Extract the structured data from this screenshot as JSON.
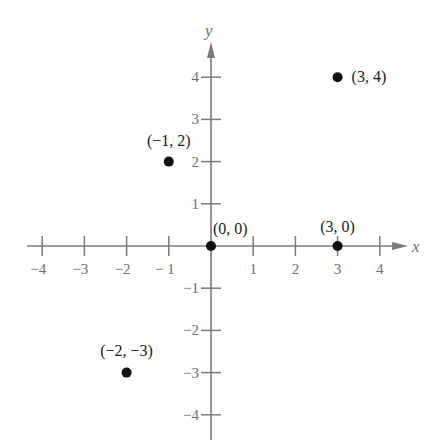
{
  "chart_data": {
    "type": "scatter",
    "title": "",
    "xlabel": "x",
    "ylabel": "y",
    "xlim": [
      -4,
      4
    ],
    "ylim": [
      -4,
      4
    ],
    "grid": false,
    "legend": null,
    "x_ticks": [
      -4,
      -3,
      -2,
      -1,
      1,
      2,
      3,
      4
    ],
    "y_ticks": [
      -4,
      -3,
      -2,
      -1,
      1,
      2,
      3,
      4
    ],
    "x_tick_labels": [
      "−4",
      "−3",
      "−2",
      "− 1",
      "1",
      "2",
      "3",
      "4"
    ],
    "y_tick_labels": [
      "−4",
      "−3",
      "−2",
      "−1",
      "1",
      "2",
      "3",
      "4"
    ],
    "series": [
      {
        "name": "points",
        "points": [
          {
            "x": 3,
            "y": 4,
            "label": "(3, 4)"
          },
          {
            "x": -1,
            "y": 2,
            "label": "(−1, 2)"
          },
          {
            "x": 0,
            "y": 0,
            "label": "(0, 0)"
          },
          {
            "x": 3,
            "y": 0,
            "label": "(3, 0)"
          },
          {
            "x": -2,
            "y": -3,
            "label": "(−2, −3)"
          }
        ]
      }
    ]
  },
  "colors": {
    "axis": "#7a7a7a",
    "tick_text": "#6e6e6e",
    "point": "#111111",
    "point_label": "#1a1a1a",
    "background": "#ffffff"
  }
}
